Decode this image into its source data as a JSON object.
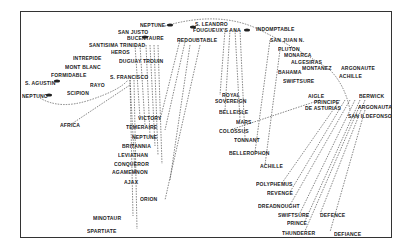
{
  "diagram": {
    "franco_spanish_ships": [
      {
        "name": "NEPTUNE",
        "x": 140,
        "y": 22
      },
      {
        "name": "SAN JUSTO",
        "x": 118,
        "y": 29
      },
      {
        "name": "BUCENTAURE",
        "x": 127,
        "y": 35
      },
      {
        "name": "REDOUBTABLE",
        "x": 177,
        "y": 37
      },
      {
        "name": "S. LEANDRO",
        "x": 195,
        "y": 21
      },
      {
        "name": "FOUGUEUX'S ANA",
        "x": 193,
        "y": 27
      },
      {
        "name": "INDOMPTABLE",
        "x": 256,
        "y": 26
      },
      {
        "name": "SANTISIMA TRINIDAD",
        "x": 89,
        "y": 42
      },
      {
        "name": "HEROS",
        "x": 111,
        "y": 49
      },
      {
        "name": "INTREPIDE",
        "x": 73,
        "y": 55
      },
      {
        "name": "DUGUAY TROUIN",
        "x": 119,
        "y": 58
      },
      {
        "name": "MONT BLANC",
        "x": 65,
        "y": 64
      },
      {
        "name": "FORMIDABLE",
        "x": 51,
        "y": 72
      },
      {
        "name": "S. FRANCISCO",
        "x": 110,
        "y": 74
      },
      {
        "name": "S. AGUSTIN",
        "x": 25,
        "y": 80
      },
      {
        "name": "RAYO",
        "x": 90,
        "y": 82
      },
      {
        "name": "SCIPION",
        "x": 67,
        "y": 90
      },
      {
        "name": "NEPTUNO",
        "x": 22,
        "y": 93
      },
      {
        "name": "SAN JUAN N.",
        "x": 270,
        "y": 37
      },
      {
        "name": "PLUTON",
        "x": 278,
        "y": 46
      },
      {
        "name": "MONARCA",
        "x": 284,
        "y": 52
      },
      {
        "name": "ALGESIRAS",
        "x": 291,
        "y": 59
      },
      {
        "name": "MONTANEZ",
        "x": 302,
        "y": 65
      },
      {
        "name": "BAHAMA",
        "x": 278,
        "y": 69
      },
      {
        "name": "ARGONAUTE",
        "x": 341,
        "y": 65
      },
      {
        "name": "ACHILLE",
        "x": 339,
        "y": 73
      },
      {
        "name": "SWIFTSURE",
        "x": 283,
        "y": 78
      },
      {
        "name": "AIGLE",
        "x": 308,
        "y": 93
      },
      {
        "name": "PRINCIPE",
        "x": 314,
        "y": 99
      },
      {
        "name": "DE ASTURIAS",
        "x": 305,
        "y": 105
      },
      {
        "name": "BERWICK",
        "x": 359,
        "y": 93
      },
      {
        "name": "ARGONAUTA",
        "x": 358,
        "y": 104
      },
      {
        "name": "SAN ILDEFONSO",
        "x": 348,
        "y": 113
      }
    ],
    "british_ships": [
      {
        "name": "AFRICA",
        "x": 60,
        "y": 122
      },
      {
        "name": "VICTORY",
        "x": 138,
        "y": 115
      },
      {
        "name": "TEMERAIRE",
        "x": 126,
        "y": 124
      },
      {
        "name": "NEPTUNE",
        "x": 132,
        "y": 134
      },
      {
        "name": "BRITANNIA",
        "x": 122,
        "y": 143
      },
      {
        "name": "LEVIATHAN",
        "x": 118,
        "y": 152
      },
      {
        "name": "CONQUEROR",
        "x": 114,
        "y": 161
      },
      {
        "name": "AGAMEMNON",
        "x": 112,
        "y": 169
      },
      {
        "name": "AJAX",
        "x": 124,
        "y": 179
      },
      {
        "name": "ORION",
        "x": 140,
        "y": 196
      },
      {
        "name": "MINOTAUR",
        "x": 93,
        "y": 215
      },
      {
        "name": "SPARTIATE",
        "x": 87,
        "y": 228
      },
      {
        "name": "ROYAL",
        "x": 222,
        "y": 92
      },
      {
        "name": "SOVEREIGN",
        "x": 215,
        "y": 98
      },
      {
        "name": "BELLEISLE",
        "x": 219,
        "y": 109
      },
      {
        "name": "MARS",
        "x": 236,
        "y": 119
      },
      {
        "name": "COLOSSUS",
        "x": 219,
        "y": 128
      },
      {
        "name": "TONNANT",
        "x": 234,
        "y": 137
      },
      {
        "name": "BELLEROPHON",
        "x": 229,
        "y": 150
      },
      {
        "name": "ACHILLE",
        "x": 260,
        "y": 163
      },
      {
        "name": "POLYPHEMUS",
        "x": 256,
        "y": 181
      },
      {
        "name": "REVENGE",
        "x": 267,
        "y": 190
      },
      {
        "name": "DREADNOUGHT",
        "x": 258,
        "y": 203
      },
      {
        "name": "SWIFTSURE",
        "x": 278,
        "y": 212
      },
      {
        "name": "PRINCE",
        "x": 287,
        "y": 220
      },
      {
        "name": "DEFENCE",
        "x": 320,
        "y": 212
      },
      {
        "name": "THUNDERER",
        "x": 282,
        "y": 230
      },
      {
        "name": "DEFIANCE",
        "x": 334,
        "y": 231
      }
    ]
  }
}
